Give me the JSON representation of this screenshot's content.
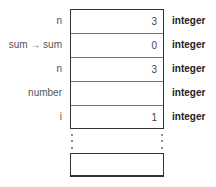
{
  "rows": [
    {
      "label": "n",
      "value": "3",
      "type": "integer"
    },
    {
      "label": "sum → sum",
      "value": "0",
      "type": "integer"
    },
    {
      "label": "n",
      "value": "3",
      "type": "integer"
    },
    {
      "label": "number",
      "value": "",
      "type": "integer"
    },
    {
      "label": "i",
      "value": "1",
      "type": "integer"
    }
  ],
  "continuation": "ellipsis-dots"
}
